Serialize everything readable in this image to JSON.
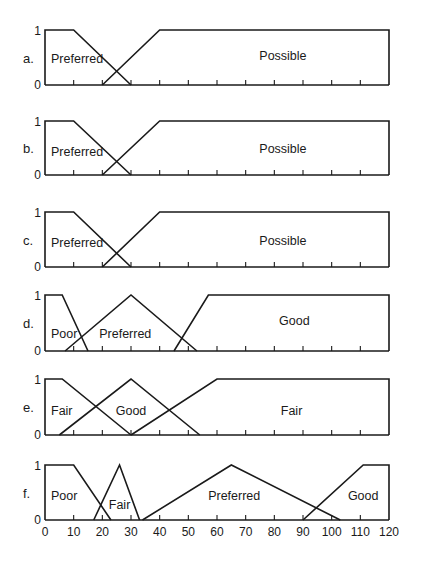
{
  "chart_data": [
    {
      "type": "line",
      "panel_label": "a.",
      "xlim": [
        0,
        120
      ],
      "ylim": [
        0,
        1
      ],
      "y_tick_labels": [
        "0",
        "1"
      ],
      "x_ticks": [
        10,
        20,
        30,
        40,
        50,
        60,
        70,
        80,
        90,
        100,
        110
      ],
      "series": [
        {
          "name": "Preferred",
          "points": [
            [
              0,
              1
            ],
            [
              10,
              1
            ],
            [
              30,
              0
            ]
          ],
          "label_at": [
            10,
            0.5
          ]
        },
        {
          "name": "Possible",
          "points": [
            [
              20,
              0
            ],
            [
              40,
              1
            ],
            [
              120,
              1
            ],
            [
              120,
              0
            ]
          ],
          "label_at": [
            83,
            0.55
          ]
        }
      ]
    },
    {
      "type": "line",
      "panel_label": "b.",
      "xlim": [
        0,
        120
      ],
      "ylim": [
        0,
        1
      ],
      "y_tick_labels": [
        "0",
        "1"
      ],
      "x_ticks": [
        10,
        20,
        30,
        40,
        50,
        60,
        70,
        80,
        90,
        100,
        110
      ],
      "series": [
        {
          "name": "Preferred",
          "points": [
            [
              0,
              1
            ],
            [
              10,
              1
            ],
            [
              30,
              0
            ]
          ],
          "label_at": [
            10,
            0.45
          ]
        },
        {
          "name": "Possible",
          "points": [
            [
              20,
              0
            ],
            [
              40,
              1
            ],
            [
              120,
              1
            ],
            [
              120,
              0
            ]
          ],
          "label_at": [
            83,
            0.5
          ]
        }
      ]
    },
    {
      "type": "line",
      "panel_label": "c.",
      "xlim": [
        0,
        120
      ],
      "ylim": [
        0,
        1
      ],
      "y_tick_labels": [
        "0",
        "1"
      ],
      "x_ticks": [
        10,
        20,
        30,
        40,
        50,
        60,
        70,
        80,
        90,
        100,
        110
      ],
      "series": [
        {
          "name": "Preferred",
          "points": [
            [
              0,
              1
            ],
            [
              10,
              1
            ],
            [
              30,
              0
            ]
          ],
          "label_at": [
            10,
            0.45
          ]
        },
        {
          "name": "Possible",
          "points": [
            [
              20,
              0
            ],
            [
              40,
              1
            ],
            [
              120,
              1
            ],
            [
              120,
              0
            ]
          ],
          "label_at": [
            83,
            0.5
          ]
        }
      ]
    },
    {
      "type": "line",
      "panel_label": "d.",
      "xlim": [
        0,
        120
      ],
      "ylim": [
        0,
        1
      ],
      "y_tick_labels": [
        "0",
        "1"
      ],
      "x_ticks": [
        10,
        20,
        30,
        40,
        50,
        60,
        70,
        80,
        90,
        100,
        110
      ],
      "series": [
        {
          "name": "Poor",
          "points": [
            [
              0,
              1
            ],
            [
              6,
              1
            ],
            [
              15,
              0
            ]
          ],
          "label_at": [
            5,
            0.32
          ]
        },
        {
          "name": "Preferred",
          "points": [
            [
              7,
              0
            ],
            [
              30,
              1
            ],
            [
              53,
              0
            ]
          ],
          "label_at": [
            28,
            0.32
          ]
        },
        {
          "name": "Good",
          "points": [
            [
              45,
              0
            ],
            [
              57,
              1
            ],
            [
              120,
              1
            ],
            [
              120,
              0
            ]
          ],
          "label_at": [
            87,
            0.55
          ]
        }
      ]
    },
    {
      "type": "line",
      "panel_label": "e.",
      "xlim": [
        0,
        120
      ],
      "ylim": [
        0,
        1
      ],
      "y_tick_labels": [
        "0",
        "1"
      ],
      "x_ticks": [
        10,
        20,
        30,
        40,
        50,
        60,
        70,
        80,
        90,
        100,
        110
      ],
      "series": [
        {
          "name": "Fair",
          "points": [
            [
              0,
              1
            ],
            [
              6,
              1
            ],
            [
              30,
              0
            ]
          ],
          "label_at": [
            5,
            0.45
          ]
        },
        {
          "name": "Good",
          "points": [
            [
              5,
              0
            ],
            [
              30,
              1
            ],
            [
              54,
              0
            ]
          ],
          "label_at": [
            30,
            0.45
          ]
        },
        {
          "name": "Fair",
          "points": [
            [
              30,
              0
            ],
            [
              60,
              1
            ],
            [
              120,
              1
            ],
            [
              120,
              0
            ]
          ],
          "label_at": [
            86,
            0.45
          ]
        }
      ]
    },
    {
      "type": "line",
      "panel_label": "f.",
      "xlim": [
        0,
        120
      ],
      "ylim": [
        0,
        1
      ],
      "y_tick_labels": [
        "0",
        "1"
      ],
      "x_ticks": [
        10,
        20,
        30,
        40,
        50,
        60,
        70,
        80,
        90,
        100,
        110
      ],
      "x_tick_labels": [
        "0",
        "10",
        "20",
        "30",
        "40",
        "50",
        "60",
        "70",
        "80",
        "90",
        "100",
        "110",
        "120"
      ],
      "x_tick_label_values": [
        0,
        10,
        20,
        30,
        40,
        50,
        60,
        70,
        80,
        90,
        100,
        110,
        120
      ],
      "series": [
        {
          "name": "Poor",
          "points": [
            [
              0,
              1
            ],
            [
              10,
              1
            ],
            [
              23,
              0
            ]
          ],
          "label_at": [
            7,
            0.45
          ]
        },
        {
          "name": "Fair",
          "points": [
            [
              17,
              0
            ],
            [
              26,
              1
            ],
            [
              33,
              0
            ]
          ],
          "label_at": [
            26,
            0.3
          ]
        },
        {
          "name": "Preferred",
          "points": [
            [
              34,
              0
            ],
            [
              65,
              1
            ],
            [
              103,
              0
            ]
          ],
          "label_at": [
            66,
            0.45
          ]
        },
        {
          "name": "Good",
          "points": [
            [
              90,
              0
            ],
            [
              111,
              1
            ],
            [
              120,
              1
            ],
            [
              120,
              0
            ]
          ],
          "label_at": [
            111,
            0.45
          ]
        }
      ]
    }
  ]
}
